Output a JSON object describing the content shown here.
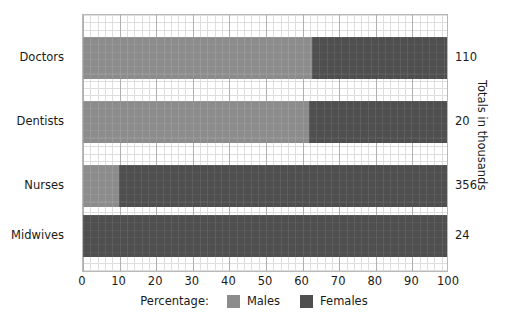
{
  "chart_data": {
    "type": "bar",
    "orientation": "horizontal",
    "stacked": true,
    "title": "",
    "xlabel": "Percentage:",
    "ylabel": "",
    "right_axis_label": "Totals in thousands",
    "xlim": [
      0,
      100
    ],
    "grid": true,
    "legend_position": "bottom-center",
    "categories": [
      "Doctors",
      "Dentists",
      "Nurses",
      "Midwives"
    ],
    "tick_labels": [
      "0",
      "10",
      "20",
      "30",
      "40",
      "50",
      "60",
      "70",
      "80",
      "90",
      "100"
    ],
    "tick_values": [
      0,
      10,
      20,
      30,
      40,
      50,
      60,
      70,
      80,
      90,
      100
    ],
    "series": [
      {
        "name": "Males",
        "color": "#8c8c8c",
        "values": [
          63,
          62,
          10,
          0
        ]
      },
      {
        "name": "Females",
        "color": "#4f4f4f",
        "values": [
          37,
          38,
          90,
          100
        ]
      }
    ],
    "totals": [
      "110",
      "20",
      "356",
      "24"
    ],
    "totals_values": [
      110,
      20,
      356,
      24
    ],
    "rows": [
      {
        "category": "Doctors",
        "males": 63,
        "females": 37,
        "total": "110"
      },
      {
        "category": "Dentists",
        "males": 62,
        "females": 38,
        "total": "20"
      },
      {
        "category": "Nurses",
        "males": 10,
        "females": 90,
        "total": "356"
      },
      {
        "category": "Midwives",
        "males": 0,
        "females": 100,
        "total": "24"
      }
    ]
  },
  "legend": {
    "title": "Percentage:",
    "items": [
      {
        "label": "Males",
        "color": "#8c8c8c"
      },
      {
        "label": "Females",
        "color": "#4f4f4f"
      }
    ]
  },
  "axes": {
    "right_title": "Totals in thousands"
  },
  "colors": {
    "males": "#8c8c8c",
    "females": "#4f4f4f",
    "grid_major": "#b0b0b0",
    "grid_minor": "#dedede",
    "frame": "#b9b9b9",
    "text": "#1a1a1a"
  }
}
